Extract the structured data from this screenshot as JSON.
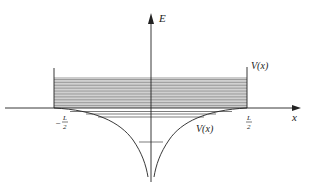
{
  "diagram": {
    "axes": {
      "x_label": "x",
      "y_label": "E"
    },
    "labels": {
      "potential_upper": "V(x)",
      "potential_lower": "V(x)",
      "left_bound_sign": "−",
      "left_bound_num": "L",
      "left_bound_den": "2",
      "right_bound_num": "L",
      "right_bound_den": "2"
    },
    "levels": {
      "continuum_band_count": 20,
      "bound_levels_count": 4
    },
    "colors": {
      "line": "#222222",
      "band": "#555555",
      "background": "#ffffff"
    }
  }
}
